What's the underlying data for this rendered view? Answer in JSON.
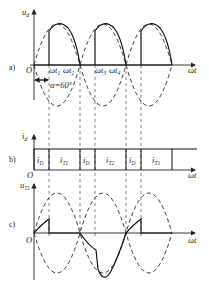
{
  "panel_a": {
    "tag": "a)",
    "y_label": "u",
    "y_sub": "d",
    "x_label": "ωt",
    "origin": "O",
    "times": [
      {
        "label": "ωt",
        "sub": "1"
      },
      {
        "label": "ωt",
        "sub": "2"
      },
      {
        "label": "ωt",
        "sub": "3"
      },
      {
        "label": "ωt",
        "sub": "4"
      }
    ],
    "alpha_label": "α=60°"
  },
  "panel_b": {
    "tag": "b)",
    "y_label": "i",
    "y_sub": "d",
    "x_label": "ωt",
    "origin": "O",
    "segments": [
      {
        "label": "i",
        "sub": "D"
      },
      {
        "label": "i",
        "sub": "T1"
      },
      {
        "label": "i",
        "sub": "D"
      },
      {
        "label": "i",
        "sub": "T2"
      },
      {
        "label": "i",
        "sub": "D"
      },
      {
        "label": "i",
        "sub": "T1"
      }
    ]
  },
  "panel_c": {
    "tag": "c)",
    "y_label": "u",
    "y_sub": "T1",
    "x_label": "ωt",
    "origin": "O"
  },
  "colors": {
    "line": "#111111",
    "background": "#ffffff"
  }
}
